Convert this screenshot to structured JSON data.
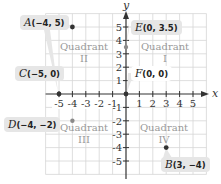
{
  "diagram": {
    "axes": {
      "x_label": "x",
      "y_label": "y",
      "x_ticks": [
        "-5",
        "-4",
        "-3",
        "-2",
        "-1",
        "1",
        "2",
        "3",
        "4",
        "5"
      ],
      "y_ticks": [
        "5",
        "4",
        "3",
        "2",
        "1",
        "-1",
        "-2",
        "-3",
        "-4",
        "-5"
      ],
      "range": [
        -6,
        6
      ]
    },
    "quadrants": [
      {
        "word": "Quadrant",
        "numeral": "I"
      },
      {
        "word": "Quadrant",
        "numeral": "II"
      },
      {
        "word": "Quadrant",
        "numeral": "III"
      },
      {
        "word": "Quadrant",
        "numeral": "IV"
      }
    ],
    "points": [
      {
        "name": "A",
        "coords": "(−4, 5)",
        "x": -4,
        "y": 5
      },
      {
        "name": "B",
        "coords": "(3, −4)",
        "x": 3,
        "y": -4
      },
      {
        "name": "C",
        "coords": "(−5, 0)",
        "x": -5,
        "y": 0
      },
      {
        "name": "D",
        "coords": "(−4, −2)",
        "x": -4,
        "y": -2
      },
      {
        "name": "E",
        "coords": "(0, 3.5)",
        "x": 0,
        "y": 3.5
      },
      {
        "name": "F",
        "coords": "(0, 0)",
        "x": 0,
        "y": 0
      }
    ],
    "colors": {
      "grid": "#d6d6d6",
      "axis": "#333333",
      "label_bg": "#e6e6e6",
      "quadrant_text": "#9a9a9a",
      "dark_point": "#333333",
      "gray_point": "#8a8a8a"
    }
  }
}
